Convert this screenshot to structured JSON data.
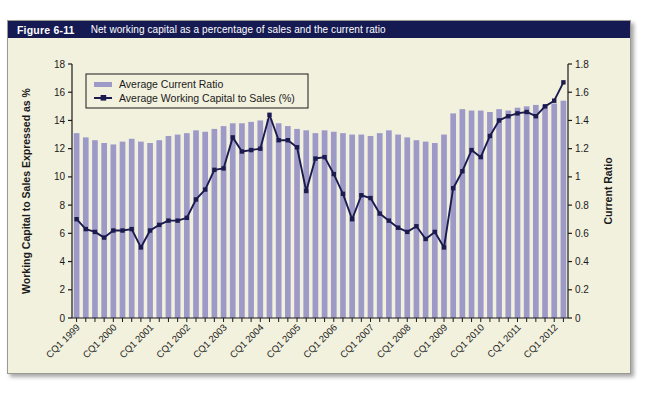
{
  "figure": {
    "number": "Figure 6-11",
    "title": "Net working capital as a percentage of sales and the current ratio"
  },
  "colors": {
    "title_bar": "#151a52",
    "title_text": "#ffffff",
    "panel_bg": "#f2f1de",
    "bar": "#9e9ac8",
    "line": "#1b1b4f",
    "axis": "#1a1a1a",
    "border": "#9a9a90"
  },
  "legend": {
    "position": "top-left",
    "items": [
      {
        "label": "Average Current Ratio",
        "marker": "bar-swatch-icon"
      },
      {
        "label": "Average Working Capital to Sales (%)",
        "marker": "line-square-marker-icon"
      }
    ]
  },
  "chart_data": {
    "type": "bar",
    "title": "Net working capital as a percentage of sales and the current ratio",
    "xlabel": "",
    "ylabel": "Working Capital to Sales Expressed as %",
    "y2label": "Current Ratio",
    "ylim": [
      0,
      18
    ],
    "y2lim": [
      0,
      1.8
    ],
    "yticks": [
      "0",
      "2",
      "4",
      "6",
      "8",
      "10",
      "12",
      "14",
      "16",
      "18"
    ],
    "y2ticks": [
      "0",
      "0.2",
      "0.4",
      "0.6",
      "0.8",
      "1",
      "1.2",
      "1.4",
      "1.6",
      "1.8"
    ],
    "grid": false,
    "legend_position": "upper left",
    "xtick_labels": [
      "CQ1 1999",
      "CQ1 2000",
      "CQ1 2001",
      "CQ1 2002",
      "CQ1 2003",
      "CQ1 2004",
      "CQ1 2005",
      "CQ1 2006",
      "CQ1 2007",
      "CQ1 2008",
      "CQ1 2009",
      "CQ1 2010",
      "CQ1 2011",
      "CQ1 2012"
    ],
    "xtick_rotation": 45,
    "xtick_every": 4,
    "x": [
      "CQ1 1999",
      "CQ2 1999",
      "CQ3 1999",
      "CQ4 1999",
      "CQ1 2000",
      "CQ2 2000",
      "CQ3 2000",
      "CQ4 2000",
      "CQ1 2001",
      "CQ2 2001",
      "CQ3 2001",
      "CQ4 2001",
      "CQ1 2002",
      "CQ2 2002",
      "CQ3 2002",
      "CQ4 2002",
      "CQ1 2003",
      "CQ2 2003",
      "CQ3 2003",
      "CQ4 2003",
      "CQ1 2004",
      "CQ2 2004",
      "CQ3 2004",
      "CQ4 2004",
      "CQ1 2005",
      "CQ2 2005",
      "CQ3 2005",
      "CQ4 2005",
      "CQ1 2006",
      "CQ2 2006",
      "CQ3 2006",
      "CQ4 2006",
      "CQ1 2007",
      "CQ2 2007",
      "CQ3 2007",
      "CQ4 2007",
      "CQ1 2008",
      "CQ2 2008",
      "CQ3 2008",
      "CQ4 2008",
      "CQ1 2009",
      "CQ2 2009",
      "CQ3 2009",
      "CQ4 2009",
      "CQ1 2010",
      "CQ2 2010",
      "CQ3 2010",
      "CQ4 2010",
      "CQ1 2011",
      "CQ2 2011",
      "CQ3 2011",
      "CQ4 2011",
      "CQ1 2012",
      "CQ2 2012"
    ],
    "series": [
      {
        "name": "Average Current Ratio",
        "type": "bar",
        "axis": "right",
        "unit": "ratio",
        "values": [
          1.31,
          1.28,
          1.26,
          1.24,
          1.23,
          1.25,
          1.27,
          1.25,
          1.24,
          1.26,
          1.29,
          1.3,
          1.31,
          1.33,
          1.32,
          1.34,
          1.36,
          1.38,
          1.38,
          1.39,
          1.4,
          1.41,
          1.38,
          1.36,
          1.34,
          1.33,
          1.31,
          1.33,
          1.32,
          1.31,
          1.3,
          1.3,
          1.29,
          1.31,
          1.33,
          1.3,
          1.28,
          1.26,
          1.25,
          1.24,
          1.3,
          1.45,
          1.48,
          1.47,
          1.47,
          1.46,
          1.48,
          1.47,
          1.49,
          1.5,
          1.51,
          1.51,
          1.52,
          1.54
        ]
      },
      {
        "name": "Average Working Capital to Sales (%)",
        "type": "line",
        "axis": "left",
        "unit": "percent",
        "values": [
          7.0,
          6.3,
          6.1,
          5.7,
          6.2,
          6.2,
          6.3,
          5.0,
          6.2,
          6.6,
          6.9,
          6.9,
          7.1,
          8.4,
          9.1,
          10.5,
          10.6,
          12.8,
          11.8,
          11.9,
          12.0,
          14.4,
          12.6,
          12.6,
          12.1,
          9.0,
          11.3,
          11.4,
          10.2,
          8.8,
          7.0,
          8.7,
          8.5,
          7.4,
          6.9,
          6.4,
          6.1,
          6.5,
          5.6,
          6.1,
          5.0,
          9.2,
          10.4,
          11.9,
          11.4,
          12.9,
          14.0,
          14.3,
          14.5,
          14.6,
          14.3,
          15.0,
          15.4,
          16.7
        ]
      }
    ]
  }
}
